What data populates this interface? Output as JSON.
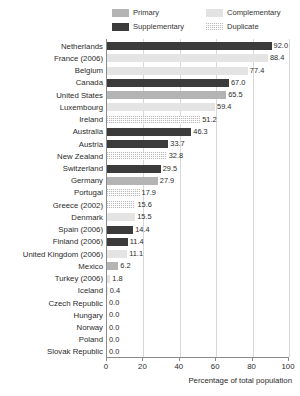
{
  "chart_data": {
    "type": "bar",
    "orientation": "horizontal",
    "title": "",
    "xlabel": "Percentage of total population",
    "ylabel": "",
    "xlim": [
      0,
      100
    ],
    "xticks": [
      0,
      20,
      40,
      60,
      80,
      100
    ],
    "grid": true,
    "legend_position": "top",
    "legend": [
      {
        "name": "Primary",
        "color": "#b4b4b4",
        "pattern": "solid-gray",
        "key": "primary"
      },
      {
        "name": "Complementary",
        "color": "#e2e2e2",
        "pattern": "solid-light",
        "key": "complementary"
      },
      {
        "name": "Supplementary",
        "color": "#3b3b3b",
        "pattern": "solid-dark",
        "key": "supplementary"
      },
      {
        "name": "Duplicate",
        "color": "#bdbdbd",
        "pattern": "dotted-hatch",
        "key": "duplicate"
      }
    ],
    "categories": [
      "Netherlands",
      "France (2006)",
      "Belgium",
      "Canada",
      "United States",
      "Luxembourg",
      "Ireland",
      "Australia",
      "Austria",
      "New Zealand",
      "Switzerland",
      "Germany",
      "Portugal",
      "Greece (2002)",
      "Denmark",
      "Spain (2006)",
      "Finland (2006)",
      "United Kingdom (2006)",
      "Mexico",
      "Turkey (2006)",
      "Iceland",
      "Czech Republic",
      "Hungary",
      "Norway",
      "Poland",
      "Slovak Republic"
    ],
    "values": [
      92.0,
      88.4,
      77.4,
      67.0,
      65.5,
      59.4,
      51.2,
      46.3,
      33.7,
      32.8,
      29.5,
      27.9,
      17.9,
      15.6,
      15.5,
      14.4,
      11.4,
      11.1,
      6.2,
      1.8,
      0.4,
      0.0,
      0.0,
      0.0,
      0.0,
      0.0
    ],
    "value_labels": [
      "92.0",
      "88.4",
      "77.4",
      "67.0",
      "65.5",
      "59.4",
      "51.2",
      "46.3",
      "33.7",
      "32.8",
      "29.5",
      "27.9",
      "17.9",
      "15.6",
      "15.5",
      "14.4",
      "11.4",
      "11.1",
      "6.2",
      "1.8",
      "0.4",
      "0.0",
      "0.0",
      "0.0",
      "0.0",
      "0.0"
    ],
    "series_keys": [
      "supplementary",
      "complementary",
      "complementary",
      "supplementary",
      "primary",
      "complementary",
      "duplicate",
      "supplementary",
      "supplementary",
      "duplicate",
      "supplementary",
      "primary",
      "duplicate",
      "duplicate",
      "complementary",
      "supplementary",
      "supplementary",
      "complementary",
      "primary",
      "complementary",
      "complementary",
      "complementary",
      "complementary",
      "complementary",
      "complementary",
      "complementary"
    ]
  }
}
